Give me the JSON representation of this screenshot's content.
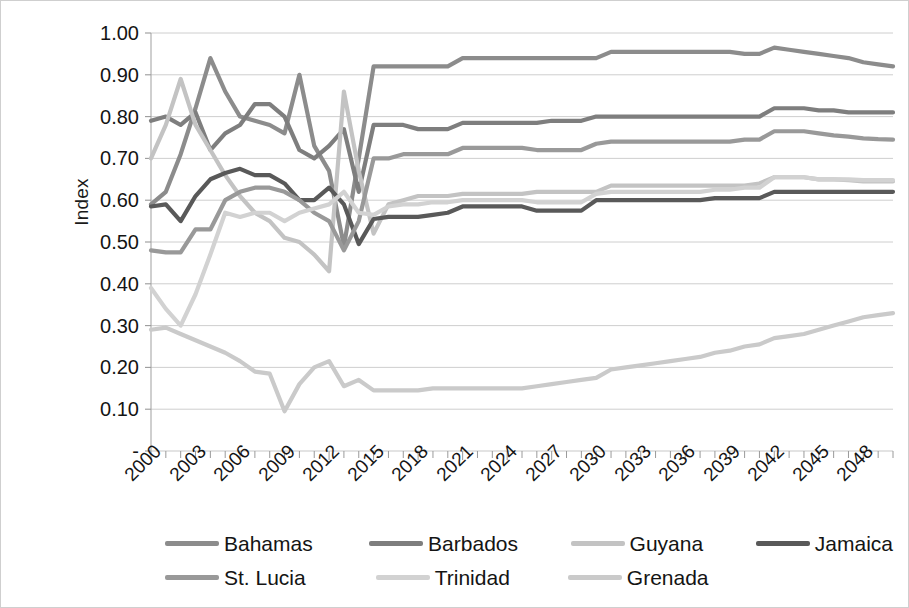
{
  "chart_data": {
    "type": "line",
    "title": "",
    "xlabel": "",
    "ylabel": "Index",
    "ylim": [
      0,
      1.0
    ],
    "xlim": [
      2000,
      2050
    ],
    "grid": true,
    "legend_position": "bottom",
    "ytick_labels": [
      "1.00",
      "0.90",
      "0.80",
      "0.70",
      "0.60",
      "0.50",
      "0.40",
      "0.30",
      "0.20",
      "0.10",
      "-"
    ],
    "ytick_values": [
      1.0,
      0.9,
      0.8,
      0.7,
      0.6,
      0.5,
      0.4,
      0.3,
      0.2,
      0.1,
      0.0
    ],
    "xtick_labels": [
      "2000",
      "2003",
      "2006",
      "2009",
      "2012",
      "2015",
      "2018",
      "2021",
      "2024",
      "2027",
      "2030",
      "2033",
      "2036",
      "2039",
      "2042",
      "2045",
      "2048"
    ],
    "xtick_values": [
      2000,
      2003,
      2006,
      2009,
      2012,
      2015,
      2018,
      2021,
      2024,
      2027,
      2030,
      2033,
      2036,
      2039,
      2042,
      2045,
      2048
    ],
    "x": [
      2000,
      2001,
      2002,
      2003,
      2004,
      2005,
      2006,
      2007,
      2008,
      2009,
      2010,
      2011,
      2012,
      2013,
      2014,
      2015,
      2016,
      2017,
      2018,
      2019,
      2020,
      2021,
      2022,
      2023,
      2024,
      2025,
      2026,
      2027,
      2028,
      2029,
      2030,
      2031,
      2032,
      2033,
      2034,
      2035,
      2036,
      2037,
      2038,
      2039,
      2040,
      2041,
      2042,
      2043,
      2044,
      2045,
      2046,
      2047,
      2048,
      2049,
      2050
    ],
    "series": [
      {
        "name": "Bahamas",
        "color": "#8c8c8c",
        "values": [
          0.59,
          0.62,
          0.71,
          0.82,
          0.94,
          0.86,
          0.8,
          0.79,
          0.78,
          0.76,
          0.9,
          0.73,
          0.67,
          0.49,
          0.7,
          0.92,
          0.92,
          0.92,
          0.92,
          0.92,
          0.92,
          0.94,
          0.94,
          0.94,
          0.94,
          0.94,
          0.94,
          0.94,
          0.94,
          0.94,
          0.94,
          0.955,
          0.955,
          0.955,
          0.955,
          0.955,
          0.955,
          0.955,
          0.955,
          0.955,
          0.95,
          0.95,
          0.965,
          0.96,
          0.955,
          0.95,
          0.945,
          0.94,
          0.93,
          0.925,
          0.92
        ]
      },
      {
        "name": "Barbados",
        "color": "#7e7e7e",
        "values": [
          0.79,
          0.8,
          0.78,
          0.81,
          0.72,
          0.76,
          0.78,
          0.83,
          0.83,
          0.8,
          0.72,
          0.7,
          0.73,
          0.77,
          0.62,
          0.78,
          0.78,
          0.78,
          0.77,
          0.77,
          0.77,
          0.785,
          0.785,
          0.785,
          0.785,
          0.785,
          0.785,
          0.79,
          0.79,
          0.79,
          0.8,
          0.8,
          0.8,
          0.8,
          0.8,
          0.8,
          0.8,
          0.8,
          0.8,
          0.8,
          0.8,
          0.8,
          0.82,
          0.82,
          0.82,
          0.815,
          0.815,
          0.81,
          0.81,
          0.81,
          0.81
        ]
      },
      {
        "name": "Guyana",
        "color": "#c3c3c3",
        "values": [
          0.7,
          0.78,
          0.89,
          0.78,
          0.72,
          0.66,
          0.61,
          0.57,
          0.55,
          0.51,
          0.5,
          0.47,
          0.43,
          0.86,
          0.67,
          0.52,
          0.59,
          0.6,
          0.61,
          0.61,
          0.61,
          0.615,
          0.615,
          0.615,
          0.615,
          0.615,
          0.62,
          0.62,
          0.62,
          0.62,
          0.62,
          0.635,
          0.635,
          0.635,
          0.635,
          0.635,
          0.635,
          0.635,
          0.635,
          0.635,
          0.635,
          0.64,
          0.655,
          0.655,
          0.655,
          0.65,
          0.65,
          0.648,
          0.645,
          0.645,
          0.645
        ]
      },
      {
        "name": "Jamaica",
        "color": "#595959",
        "values": [
          0.585,
          0.59,
          0.55,
          0.61,
          0.65,
          0.665,
          0.675,
          0.66,
          0.66,
          0.64,
          0.6,
          0.6,
          0.63,
          0.59,
          0.495,
          0.555,
          0.56,
          0.56,
          0.56,
          0.565,
          0.57,
          0.585,
          0.585,
          0.585,
          0.585,
          0.585,
          0.575,
          0.575,
          0.575,
          0.575,
          0.6,
          0.6,
          0.6,
          0.6,
          0.6,
          0.6,
          0.6,
          0.6,
          0.605,
          0.605,
          0.605,
          0.605,
          0.62,
          0.62,
          0.62,
          0.62,
          0.62,
          0.62,
          0.62,
          0.62,
          0.62
        ]
      },
      {
        "name": "St. Lucia",
        "color": "#999999",
        "values": [
          0.48,
          0.475,
          0.475,
          0.53,
          0.53,
          0.6,
          0.62,
          0.63,
          0.63,
          0.62,
          0.6,
          0.57,
          0.55,
          0.48,
          0.55,
          0.7,
          0.7,
          0.71,
          0.71,
          0.71,
          0.71,
          0.725,
          0.725,
          0.725,
          0.725,
          0.725,
          0.72,
          0.72,
          0.72,
          0.72,
          0.735,
          0.74,
          0.74,
          0.74,
          0.74,
          0.74,
          0.74,
          0.74,
          0.74,
          0.74,
          0.745,
          0.745,
          0.765,
          0.765,
          0.765,
          0.76,
          0.755,
          0.752,
          0.748,
          0.746,
          0.745
        ]
      },
      {
        "name": "Trinidad",
        "color": "#d2d2d2",
        "values": [
          0.39,
          0.34,
          0.3,
          0.375,
          0.47,
          0.57,
          0.56,
          0.57,
          0.57,
          0.55,
          0.57,
          0.58,
          0.59,
          0.62,
          0.57,
          0.565,
          0.585,
          0.59,
          0.59,
          0.595,
          0.595,
          0.6,
          0.6,
          0.6,
          0.6,
          0.6,
          0.595,
          0.595,
          0.595,
          0.595,
          0.615,
          0.62,
          0.62,
          0.62,
          0.62,
          0.62,
          0.62,
          0.62,
          0.625,
          0.625,
          0.63,
          0.63,
          0.655,
          0.655,
          0.655,
          0.65,
          0.65,
          0.65,
          0.648,
          0.648,
          0.648
        ]
      },
      {
        "name": "Grenada",
        "color": "#cacaca",
        "values": [
          0.29,
          0.295,
          0.28,
          0.265,
          0.25,
          0.235,
          0.215,
          0.19,
          0.185,
          0.095,
          0.16,
          0.2,
          0.215,
          0.155,
          0.17,
          0.145,
          0.145,
          0.145,
          0.145,
          0.15,
          0.15,
          0.15,
          0.15,
          0.15,
          0.15,
          0.15,
          0.155,
          0.16,
          0.165,
          0.17,
          0.175,
          0.195,
          0.2,
          0.205,
          0.21,
          0.215,
          0.22,
          0.225,
          0.235,
          0.24,
          0.25,
          0.255,
          0.27,
          0.275,
          0.28,
          0.29,
          0.3,
          0.31,
          0.32,
          0.325,
          0.33
        ]
      }
    ]
  },
  "legend": {
    "items": [
      {
        "label": "Bahamas",
        "color": "#8c8c8c"
      },
      {
        "label": "Barbados",
        "color": "#7e7e7e"
      },
      {
        "label": "Guyana",
        "color": "#c3c3c3"
      },
      {
        "label": "Jamaica",
        "color": "#595959"
      },
      {
        "label": "St. Lucia",
        "color": "#999999"
      },
      {
        "label": "Trinidad",
        "color": "#d2d2d2"
      },
      {
        "label": "Grenada",
        "color": "#cacaca"
      }
    ]
  }
}
